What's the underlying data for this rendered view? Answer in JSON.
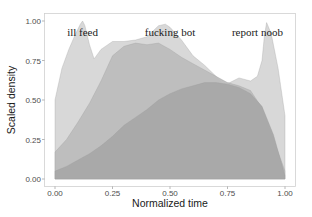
{
  "chart_data": {
    "type": "area",
    "title": "",
    "xlabel": "Normalized time",
    "ylabel": "Scaled density",
    "xlim": [
      0,
      1
    ],
    "ylim": [
      0,
      1
    ],
    "x_ticks": [
      "0.00",
      "0.25",
      "0.50",
      "0.75",
      "1.00"
    ],
    "y_ticks": [
      "0.00",
      "0.25",
      "0.50",
      "0.75",
      "1.00"
    ],
    "grid": false,
    "legend": "none",
    "annotations": [
      {
        "text": "ill feed",
        "x": 0.12,
        "y": 0.93
      },
      {
        "text": "fucking bot",
        "x": 0.5,
        "y": 0.93
      },
      {
        "text": "report noob",
        "x": 0.88,
        "y": 0.93
      }
    ],
    "series": [
      {
        "name": "ill feed / report noob (lightest)",
        "color": "#d6d6d6",
        "x": [
          0.0,
          0.03,
          0.06,
          0.09,
          0.11,
          0.12,
          0.13,
          0.15,
          0.17,
          0.2,
          0.25,
          0.3,
          0.35,
          0.4,
          0.45,
          0.48,
          0.5,
          0.55,
          0.6,
          0.65,
          0.7,
          0.73,
          0.76,
          0.8,
          0.85,
          0.88,
          0.9,
          0.91,
          0.92,
          0.94,
          0.97,
          1.0
        ],
        "values": [
          0.5,
          0.7,
          0.82,
          0.92,
          0.98,
          1.0,
          0.97,
          0.85,
          0.76,
          0.82,
          0.87,
          0.87,
          0.88,
          0.9,
          0.97,
          0.98,
          0.96,
          0.88,
          0.78,
          0.72,
          0.65,
          0.6,
          0.61,
          0.64,
          0.62,
          0.65,
          0.75,
          0.9,
          0.99,
          0.92,
          0.7,
          0.4
        ]
      },
      {
        "name": "fucking bot (medium)",
        "color": "#bdbdbd",
        "x": [
          0.0,
          0.05,
          0.1,
          0.15,
          0.2,
          0.25,
          0.3,
          0.35,
          0.4,
          0.45,
          0.5,
          0.55,
          0.6,
          0.65,
          0.7,
          0.75,
          0.8,
          0.85,
          0.9,
          0.95,
          1.0
        ],
        "values": [
          0.17,
          0.25,
          0.36,
          0.48,
          0.62,
          0.78,
          0.84,
          0.86,
          0.85,
          0.86,
          0.82,
          0.77,
          0.73,
          0.69,
          0.65,
          0.61,
          0.59,
          0.56,
          0.45,
          0.25,
          0.05
        ]
      },
      {
        "name": "baseline (darkest)",
        "color": "#a8a8a8",
        "x": [
          0.0,
          0.05,
          0.1,
          0.15,
          0.2,
          0.25,
          0.3,
          0.35,
          0.4,
          0.45,
          0.5,
          0.55,
          0.6,
          0.65,
          0.7,
          0.75,
          0.8,
          0.85,
          0.9,
          0.95,
          1.0
        ],
        "values": [
          0.05,
          0.08,
          0.12,
          0.16,
          0.21,
          0.27,
          0.34,
          0.39,
          0.44,
          0.5,
          0.54,
          0.57,
          0.59,
          0.61,
          0.61,
          0.6,
          0.58,
          0.54,
          0.46,
          0.28,
          0.02
        ]
      }
    ]
  }
}
